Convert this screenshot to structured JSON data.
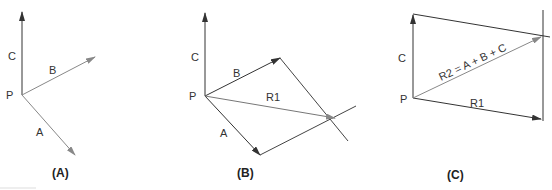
{
  "figures": [
    {
      "caption": "(A)",
      "labels": {
        "P": "P",
        "A": "A",
        "B": "B",
        "C": "C"
      }
    },
    {
      "caption": "(B)",
      "labels": {
        "P": "P",
        "A": "A",
        "B": "B",
        "C": "C",
        "R1": "R1"
      }
    },
    {
      "caption": "(C)",
      "labels": {
        "P": "P",
        "C": "C",
        "R1": "R1",
        "R2": "R2 = A + B + C"
      }
    }
  ],
  "colors": {
    "dark_line": "#333333",
    "gray_line": "#888888"
  }
}
